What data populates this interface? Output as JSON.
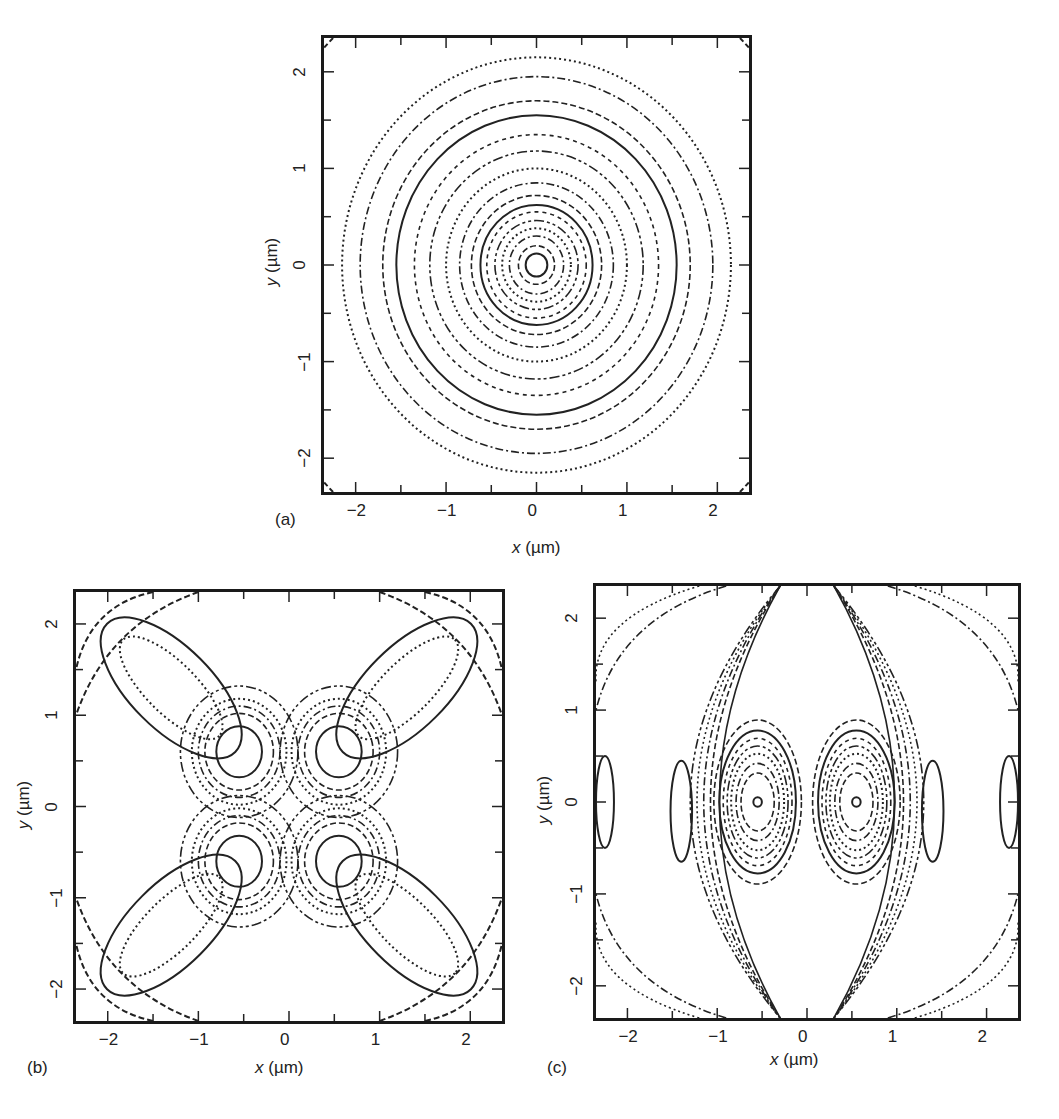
{
  "figure": {
    "panels": [
      {
        "id": "a",
        "tag": "(a)",
        "frame": {
          "left": 321,
          "top": 35,
          "width": 431,
          "height": 460
        },
        "xlabel_var": "x",
        "xlabel_unit": " (µm)",
        "ylabel_var": "y",
        "ylabel_unit": " (µm)",
        "xticks": [
          "-2",
          "-1",
          "0",
          "1",
          "2"
        ],
        "yticks": [
          "2",
          "1",
          "0",
          "-1",
          "-2"
        ],
        "tag_pos": {
          "left": 275,
          "top": 510
        },
        "xlabel_pos": {
          "left": 512,
          "top": 538
        },
        "ylabel_pos": {
          "left": 248,
          "top": 252
        }
      },
      {
        "id": "b",
        "tag": "(b)",
        "frame": {
          "left": 73,
          "top": 589,
          "width": 432,
          "height": 435
        },
        "xlabel_var": "x",
        "xlabel_unit": " (µm)",
        "ylabel_var": "y",
        "ylabel_unit": " (µm)",
        "xticks": [
          "-2",
          "-1",
          "0",
          "1",
          "2"
        ],
        "yticks": [
          "2",
          "1",
          "0",
          "-1",
          "-2"
        ],
        "tag_pos": {
          "left": 27,
          "top": 1058
        },
        "xlabel_pos": {
          "left": 255,
          "top": 1058
        },
        "ylabel_pos": {
          "left": 0,
          "top": 795
        }
      },
      {
        "id": "c",
        "tag": "(c)",
        "frame": {
          "left": 593,
          "top": 583,
          "width": 428,
          "height": 438
        },
        "xlabel_var": "x",
        "xlabel_unit": " (µm)",
        "ylabel_var": "y",
        "ylabel_unit": " (µm)",
        "xticks": [
          "-2",
          "-1",
          "0",
          "1",
          "2"
        ],
        "yticks": [
          "2",
          "1",
          "0",
          "-1",
          "-2"
        ],
        "tag_pos": {
          "left": 547,
          "top": 1058
        },
        "xlabel_pos": {
          "left": 770,
          "top": 1050
        },
        "ylabel_pos": {
          "left": 520,
          "top": 790
        }
      }
    ]
  },
  "chart_data": [
    {
      "type": "contour",
      "panel": "(a)",
      "title": "",
      "xlabel": "x (µm)",
      "ylabel": "y (µm)",
      "xlim": [
        -2.35,
        2.35
      ],
      "ylim": [
        -2.35,
        2.35
      ],
      "xticks": [
        -2,
        -1,
        0,
        1,
        2
      ],
      "yticks": [
        -2,
        -1,
        0,
        1,
        2
      ],
      "grid": false,
      "description": "Concentric circular contours centred at origin (radially symmetric mode); corner fragments near the frame",
      "contour_radii": [
        0.12,
        0.2,
        0.3,
        0.38,
        0.46,
        0.55,
        0.62,
        0.72,
        0.85,
        1.0,
        1.18,
        1.35,
        1.55,
        1.7,
        1.95,
        2.15
      ]
    },
    {
      "type": "contour",
      "panel": "(b)",
      "title": "",
      "xlabel": "x (µm)",
      "ylabel": "y (µm)",
      "xlim": [
        -2.35,
        2.35
      ],
      "ylim": [
        -2.35,
        2.35
      ],
      "xticks": [
        -2,
        -1,
        0,
        1,
        2
      ],
      "yticks": [
        -2,
        -1,
        0,
        1,
        2
      ],
      "grid": false,
      "description": "Four inner lobes at (±0.55, ±0.6) plus four outer elongated lobes at (±1.3, ±1.3) oriented along diagonals; corner arcs",
      "inner_lobes": [
        [
          -0.55,
          0.6
        ],
        [
          0.55,
          0.6
        ],
        [
          -0.55,
          -0.6
        ],
        [
          0.55,
          -0.6
        ]
      ],
      "outer_lobes": [
        [
          -1.3,
          1.3
        ],
        [
          1.3,
          1.3
        ],
        [
          -1.3,
          -1.3
        ],
        [
          1.3,
          -1.3
        ]
      ]
    },
    {
      "type": "contour",
      "panel": "(c)",
      "title": "",
      "xlabel": "x (µm)",
      "ylabel": "y (µm)",
      "xlim": [
        -2.35,
        2.35
      ],
      "ylim": [
        -2.35,
        2.35
      ],
      "xticks": [
        -2,
        -1,
        0,
        1,
        2
      ],
      "yticks": [
        -2,
        -1,
        0,
        1,
        2
      ],
      "grid": false,
      "description": "Two vertically elongated main lobes centred at (±0.55, 0) with nested contours, surrounded by curved arcs and side lobes",
      "main_lobes": [
        [
          -0.55,
          0
        ],
        [
          0.55,
          0
        ]
      ]
    }
  ]
}
